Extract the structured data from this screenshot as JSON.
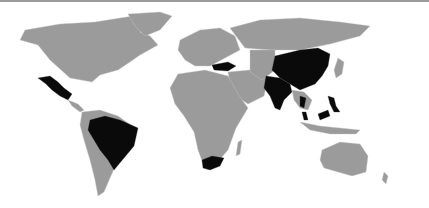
{
  "map": {
    "type": "world choropleth",
    "colors": {
      "background": "#ffffff",
      "land_default": "#9b9b9b",
      "highlighted": "#0a0a0a",
      "borders": "#c8c8c8"
    },
    "highlighted_countries": [
      "Mexico",
      "Brazil",
      "South Africa",
      "Turkey",
      "India",
      "China",
      "Thailand",
      "Philippines",
      "Malaysia"
    ],
    "caption": ""
  }
}
